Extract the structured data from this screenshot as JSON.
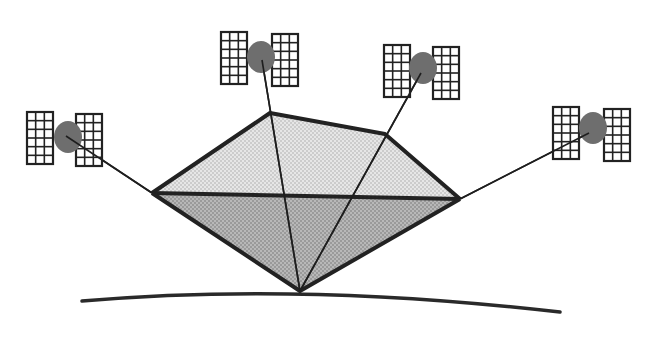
{
  "diagram": {
    "colors": {
      "background": "#ffffff",
      "stroke": "#222222",
      "upper_fill": "#d9d9d9",
      "lower_fill": "#a9a9a9",
      "satellite_body": "#6e6e6e",
      "panel_fill": "#ffffff"
    },
    "satellites": [
      {
        "id": "sat-1",
        "name": "satellite-left"
      },
      {
        "id": "sat-2",
        "name": "satellite-top-center"
      },
      {
        "id": "sat-3",
        "name": "satellite-top-right"
      },
      {
        "id": "sat-4",
        "name": "satellite-far-right"
      }
    ],
    "panel_grid": {
      "columns": 3,
      "rows": 6
    },
    "elements": {
      "earth_surface": "earth-surface-curve",
      "receiver": "ground-receiver-point",
      "upper_polygon": "upper-geometry-face",
      "lower_polygon": "lower-geometry-face"
    }
  }
}
